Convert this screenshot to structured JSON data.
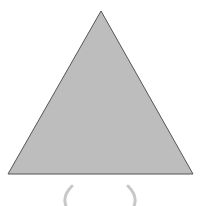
{
  "figure": {
    "shape": "triangle",
    "fill": "#bdbdbd",
    "stroke": "#555555",
    "points": [
      [
        101,
        11
      ],
      [
        8,
        174
      ],
      [
        193,
        174
      ]
    ],
    "brackets": {
      "left": "(",
      "right": ")",
      "color": "#c8c8c8"
    }
  }
}
